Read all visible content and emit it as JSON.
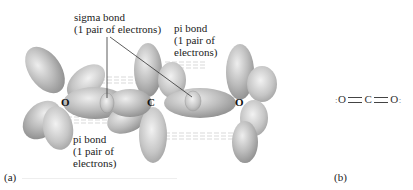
{
  "figure": {
    "panel_a": {
      "tag": "(a)",
      "labels": {
        "sigma_bond": {
          "line1": "sigma bond",
          "line2": "(1 pair of electrons)"
        },
        "pi_bond_top": {
          "line1": "pi bond",
          "line2": "(1 pair of",
          "line3": "electrons)"
        },
        "pi_bond_bottom": {
          "line1": "pi bond",
          "line2": "(1 pair of",
          "line3": "electrons)"
        }
      },
      "atoms": {
        "left": "O",
        "center": "C",
        "right": "O"
      }
    },
    "panel_b": {
      "tag": "(b)",
      "lewis_structure": {
        "left_atom": "O",
        "center_atom": "C",
        "right_atom": "O",
        "bond": "="
      }
    },
    "colors": {
      "orbital_fill": "#b8b8b8",
      "orbital_light": "#e6e6e6",
      "orbital_dark": "#8a8a8a",
      "text": "#222222"
    }
  }
}
